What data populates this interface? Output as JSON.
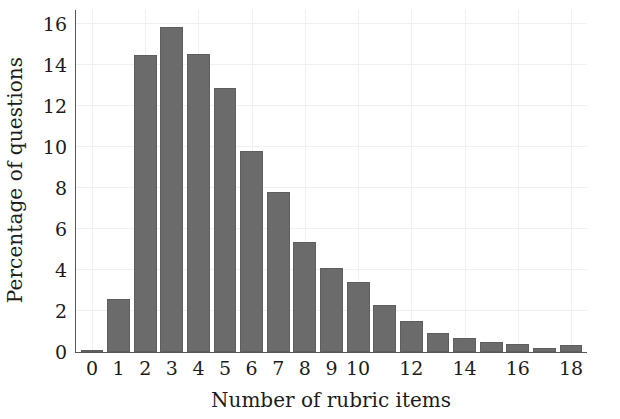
{
  "chart_data": {
    "type": "bar",
    "title": "",
    "xlabel": "Number of rubric items",
    "ylabel": "Percentage of questions",
    "categories": [
      0,
      1,
      2,
      3,
      4,
      5,
      6,
      7,
      8,
      9,
      10,
      11,
      12,
      13,
      14,
      15,
      16,
      17,
      18
    ],
    "values": [
      0.1,
      2.6,
      14.5,
      15.85,
      14.55,
      12.9,
      9.8,
      7.8,
      5.35,
      4.1,
      3.4,
      2.3,
      1.5,
      0.95,
      0.7,
      0.5,
      0.4,
      0.2,
      0.35
    ],
    "xlim": [
      -0.6,
      18.6
    ],
    "ylim": [
      0,
      16.7
    ],
    "yticks": [
      0,
      2,
      4,
      6,
      8,
      10,
      12,
      14,
      16
    ],
    "ytick_labels": [
      "0",
      "2",
      "4",
      "6",
      "8",
      "10",
      "12",
      "14",
      "16"
    ],
    "xticks": [
      0,
      1,
      2,
      3,
      4,
      5,
      6,
      7,
      8,
      9,
      10,
      12,
      14,
      16,
      18
    ],
    "xtick_labels": [
      "0",
      "1",
      "2",
      "3",
      "4",
      "5",
      "6",
      "7",
      "8",
      "9",
      "10",
      "12",
      "14",
      "16",
      "18"
    ],
    "grid": true,
    "legend": null,
    "bar_color": "#6b6b6b",
    "grid_color": "#f0f0f0",
    "axis_color": "#555555"
  }
}
